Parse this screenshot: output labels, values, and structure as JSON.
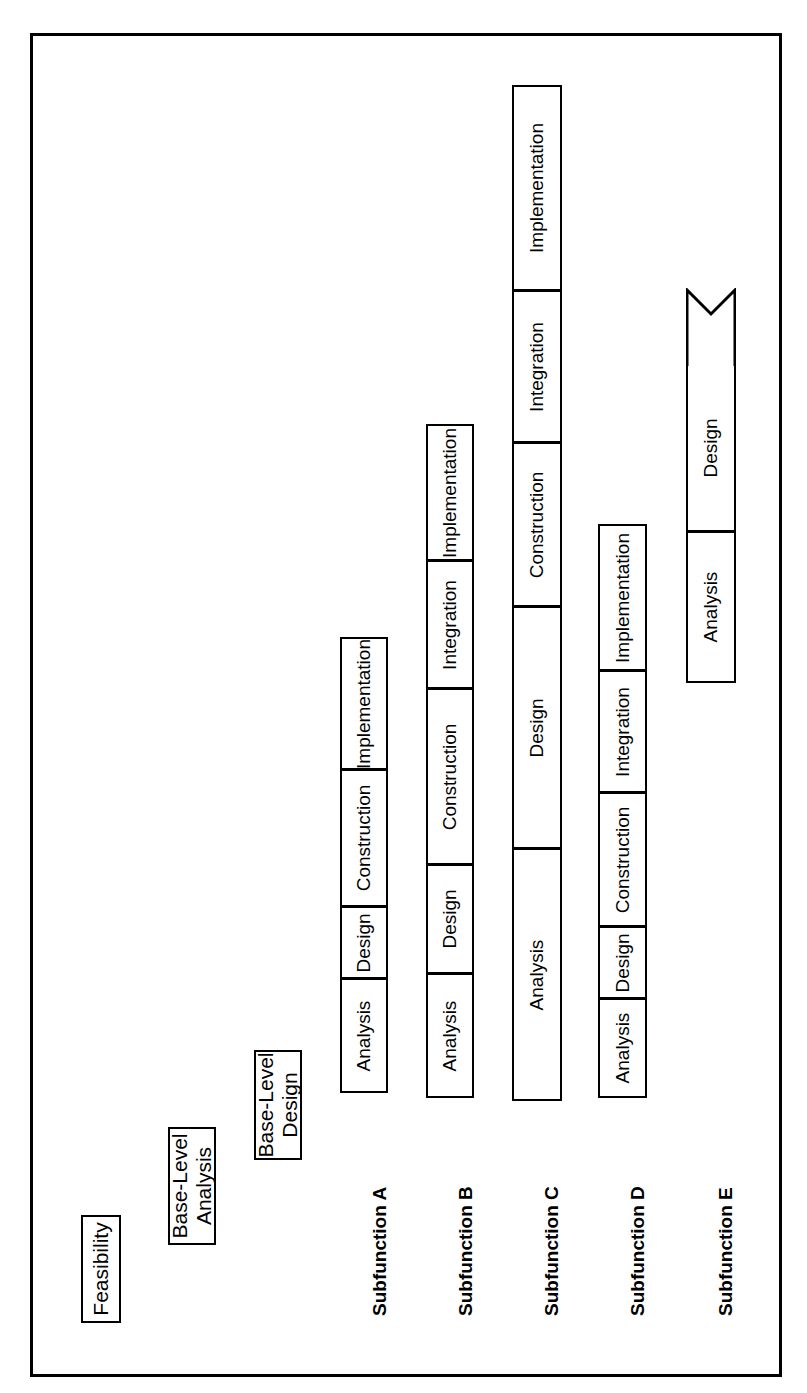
{
  "diagram": {
    "orientation": "rotated-90",
    "line_color": "#000000",
    "background_color": "#ffffff"
  },
  "milestones": [
    {
      "name": "feasibility",
      "label": "Feasibility"
    },
    {
      "name": "base-level-analysis",
      "label": "Base-Level\nAnalysis"
    },
    {
      "name": "base-level-design",
      "label": "Base-Level\nDesign"
    }
  ],
  "phase_labels": {
    "analysis": "Analysis",
    "design": "Design",
    "construction": "Construction",
    "integration": "Integration",
    "implementation": "Implementation"
  },
  "rows": [
    {
      "name": "subfunction-a",
      "label": "Subfunction A",
      "segments": [
        {
          "phase": "analysis",
          "label": "Analysis"
        },
        {
          "phase": "design",
          "label": "Design"
        },
        {
          "phase": "construction",
          "label": "Construction"
        },
        {
          "phase": "implementation",
          "label": "Implementation"
        }
      ],
      "open_end": false
    },
    {
      "name": "subfunction-b",
      "label": "Subfunction B",
      "segments": [
        {
          "phase": "analysis",
          "label": "Analysis"
        },
        {
          "phase": "design",
          "label": "Design"
        },
        {
          "phase": "construction",
          "label": "Construction"
        },
        {
          "phase": "integration",
          "label": "Integration"
        },
        {
          "phase": "implementation",
          "label": "Implementation"
        }
      ],
      "open_end": false
    },
    {
      "name": "subfunction-c",
      "label": "Subfunction C",
      "segments": [
        {
          "phase": "analysis",
          "label": "Analysis"
        },
        {
          "phase": "design",
          "label": "Design"
        },
        {
          "phase": "construction",
          "label": "Construction"
        },
        {
          "phase": "integration",
          "label": "Integration"
        },
        {
          "phase": "implementation",
          "label": "Implementation"
        }
      ],
      "open_end": false
    },
    {
      "name": "subfunction-d",
      "label": "Subfunction D",
      "segments": [
        {
          "phase": "analysis",
          "label": "Analysis"
        },
        {
          "phase": "design",
          "label": "Design"
        },
        {
          "phase": "construction",
          "label": "Construction"
        },
        {
          "phase": "integration",
          "label": "Integration"
        },
        {
          "phase": "implementation",
          "label": "Implementation"
        }
      ],
      "open_end": false
    },
    {
      "name": "subfunction-e",
      "label": "Subfunction E",
      "segments": [
        {
          "phase": "analysis",
          "label": "Analysis"
        },
        {
          "phase": "design",
          "label": "Design"
        }
      ],
      "open_end": true
    }
  ]
}
